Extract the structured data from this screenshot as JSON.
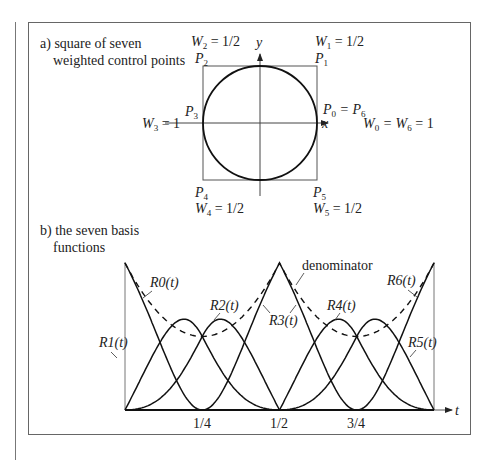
{
  "panel_a": {
    "caption_line1": "a) square of seven",
    "caption_line2": "weighted control points",
    "labels": {
      "P2": "P",
      "P2_sub": "2",
      "W2": "W",
      "W2_sub": "2",
      "W2_val": " = 1/2",
      "P1": "P",
      "P1_sub": "1",
      "W1": "W",
      "W1_sub": "1",
      "W1_val": " = 1/2",
      "P3": "P",
      "P3_sub": "3",
      "W3": "W",
      "W3_sub": "3",
      "W3_val": " = 1",
      "P0": "P",
      "P0_sub": "0",
      "P0_eq": " = P",
      "P0_sub2": "6",
      "W0": "W",
      "W0_sub": "0",
      "W0_eq": " = W",
      "W0_sub2": "6",
      "W0_val": " = 1",
      "P4": "P",
      "P4_sub": "4",
      "W4": "W",
      "W4_sub": "4",
      "W4_val": " = 1/2",
      "P5": "P",
      "P5_sub": "5",
      "W5": "W",
      "W5_sub": "5",
      "W5_val": " = 1/2",
      "x_axis": "x",
      "y_axis": "y"
    }
  },
  "panel_b": {
    "caption_line1": "b) the seven basis",
    "caption_line2": "functions",
    "denominator_label": "denominator",
    "t_axis": "t",
    "curve_labels": [
      "R0(t)",
      "R1(t)",
      "R2(t)",
      "R3(t)",
      "R4(t)",
      "R5(t)",
      "R6(t)"
    ],
    "ticks": [
      "1/4",
      "1/2",
      "3/4"
    ]
  },
  "chart_data": {
    "type": "line",
    "xlabel": "t",
    "ylabel": "",
    "x_ticks": [
      0.25,
      0.5,
      0.75
    ],
    "x_tick_labels": [
      "1/4",
      "1/2",
      "3/4"
    ],
    "xlim": [
      0,
      1
    ],
    "degree": 2,
    "knots": [
      0,
      0,
      0,
      0.25,
      0.5,
      0.5,
      0.75,
      1,
      1,
      1
    ],
    "weights": [
      1,
      0.5,
      0.5,
      1,
      0.5,
      0.5,
      1
    ],
    "series": [
      {
        "name": "R0(t)",
        "style": "solid"
      },
      {
        "name": "R1(t)",
        "style": "solid"
      },
      {
        "name": "R2(t)",
        "style": "solid"
      },
      {
        "name": "R3(t)",
        "style": "solid"
      },
      {
        "name": "R4(t)",
        "style": "solid"
      },
      {
        "name": "R5(t)",
        "style": "solid"
      },
      {
        "name": "R6(t)",
        "style": "solid"
      },
      {
        "name": "denominator",
        "style": "dashed"
      }
    ]
  }
}
